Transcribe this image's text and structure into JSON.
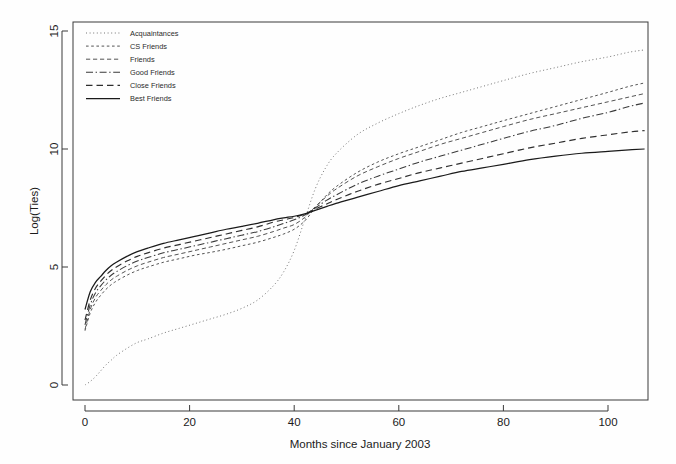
{
  "chart_data": {
    "type": "line",
    "title": "",
    "xlabel": "Months since January 2003",
    "ylabel": "Log(Ties)",
    "xlim": [
      -2,
      108
    ],
    "ylim": [
      -0.6,
      15.8
    ],
    "xticks": [
      0,
      20,
      40,
      60,
      80,
      100
    ],
    "yticks": [
      0,
      5,
      10,
      15
    ],
    "grid": false,
    "legend_position": "top-left",
    "x": [
      0,
      1,
      2,
      3,
      4,
      5,
      6,
      8,
      10,
      12,
      15,
      18,
      21,
      24,
      27,
      30,
      33,
      36,
      38,
      40,
      42,
      44,
      46,
      48,
      52,
      56,
      60,
      64,
      68,
      72,
      76,
      80,
      85,
      90,
      95,
      100,
      104,
      107
    ],
    "series": [
      {
        "name": "Acquaintances",
        "dash_style": "dotted",
        "color": "#6e6e6e",
        "values": [
          0.0,
          0.15,
          0.35,
          0.6,
          0.85,
          1.05,
          1.25,
          1.55,
          1.8,
          1.95,
          2.2,
          2.4,
          2.6,
          2.8,
          3.0,
          3.25,
          3.6,
          4.2,
          4.8,
          5.7,
          7.0,
          8.3,
          9.2,
          9.8,
          10.6,
          11.1,
          11.5,
          11.85,
          12.15,
          12.4,
          12.65,
          12.9,
          13.2,
          13.45,
          13.7,
          13.9,
          14.1,
          14.2
        ]
      },
      {
        "name": "CS Friends",
        "dash_style": "fine-dash",
        "color": "#4a4a4a",
        "values": [
          2.3,
          3.05,
          3.5,
          3.8,
          4.05,
          4.25,
          4.4,
          4.65,
          4.85,
          5.0,
          5.2,
          5.35,
          5.5,
          5.62,
          5.75,
          5.9,
          6.05,
          6.25,
          6.4,
          6.6,
          6.95,
          7.5,
          8.0,
          8.4,
          9.0,
          9.45,
          9.8,
          10.1,
          10.4,
          10.7,
          10.95,
          11.2,
          11.5,
          11.8,
          12.1,
          12.4,
          12.65,
          12.8
        ]
      },
      {
        "name": "Friends",
        "dash_style": "dash",
        "color": "#4a4a4a",
        "values": [
          2.35,
          3.2,
          3.7,
          4.0,
          4.25,
          4.45,
          4.6,
          4.85,
          5.05,
          5.2,
          5.4,
          5.55,
          5.7,
          5.85,
          6.0,
          6.15,
          6.3,
          6.5,
          6.65,
          6.8,
          7.1,
          7.55,
          7.95,
          8.3,
          8.85,
          9.25,
          9.6,
          9.9,
          10.2,
          10.45,
          10.7,
          10.95,
          11.25,
          11.5,
          11.75,
          12.0,
          12.2,
          12.35
        ]
      },
      {
        "name": "Good Friends",
        "dash_style": "dash-dot",
        "color": "#3a3a3a",
        "values": [
          2.55,
          3.4,
          3.9,
          4.2,
          4.45,
          4.65,
          4.8,
          5.05,
          5.25,
          5.4,
          5.6,
          5.75,
          5.9,
          6.05,
          6.2,
          6.35,
          6.5,
          6.7,
          6.85,
          7.0,
          7.2,
          7.5,
          7.8,
          8.05,
          8.5,
          8.85,
          9.15,
          9.45,
          9.7,
          9.95,
          10.2,
          10.45,
          10.75,
          11.0,
          11.3,
          11.55,
          11.8,
          11.95
        ]
      },
      {
        "name": "Close Friends",
        "dash_style": "long-dash",
        "color": "#2e2e2e",
        "values": [
          2.75,
          3.6,
          4.1,
          4.4,
          4.65,
          4.85,
          5.0,
          5.25,
          5.45,
          5.6,
          5.8,
          5.95,
          6.1,
          6.25,
          6.4,
          6.55,
          6.7,
          6.9,
          7.0,
          7.1,
          7.25,
          7.45,
          7.65,
          7.85,
          8.2,
          8.5,
          8.75,
          9.0,
          9.2,
          9.4,
          9.6,
          9.8,
          10.05,
          10.25,
          10.45,
          10.6,
          10.72,
          10.78
        ]
      },
      {
        "name": "Best Friends",
        "dash_style": "solid",
        "color": "#1a1a1a",
        "values": [
          3.2,
          3.95,
          4.35,
          4.6,
          4.85,
          5.05,
          5.2,
          5.45,
          5.65,
          5.8,
          6.0,
          6.15,
          6.3,
          6.45,
          6.6,
          6.72,
          6.85,
          7.0,
          7.08,
          7.15,
          7.25,
          7.4,
          7.55,
          7.7,
          7.95,
          8.2,
          8.45,
          8.65,
          8.85,
          9.05,
          9.2,
          9.35,
          9.55,
          9.7,
          9.82,
          9.9,
          9.96,
          10.0
        ]
      }
    ]
  },
  "legend": {
    "items": [
      {
        "label": "Acquaintances"
      },
      {
        "label": "CS Friends"
      },
      {
        "label": "Friends"
      },
      {
        "label": "Good Friends"
      },
      {
        "label": "Close Friends"
      },
      {
        "label": "Best Friends"
      }
    ]
  },
  "axes": {
    "y_title": "Log(Ties)",
    "x_title": "Months since January 2003",
    "x_tick_labels": [
      "0",
      "20",
      "40",
      "60",
      "80",
      "100"
    ],
    "y_tick_labels": [
      "0",
      "5",
      "10",
      "15"
    ]
  }
}
